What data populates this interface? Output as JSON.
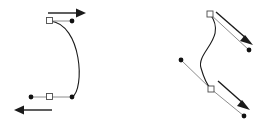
{
  "figure": {
    "background_color": "#ffffff",
    "width": 277,
    "height": 127,
    "curve_color": "#1a1a1a",
    "handle_line_color": "#6e6e6e",
    "anchor_fill_color": "#ffffff",
    "anchor_stroke_color": "#4a4a4a",
    "control_dot_color": "#111111",
    "arrow_color": "#1a1a1a"
  },
  "shapes": {
    "left_curve": {
      "name": "c-shaped-arc",
      "path": "M 50 21 C 82 24 85 90 72 97",
      "anchors": [
        {
          "label": "top-anchor",
          "x": 50,
          "y": 21
        },
        {
          "label": "bottom-anchor",
          "x": 50,
          "y": 97
        }
      ],
      "control_dots": [
        {
          "label": "top-handle-dot",
          "x": 72,
          "y": 21
        },
        {
          "label": "bottom-handle-dot-left",
          "x": 31,
          "y": 97
        },
        {
          "label": "bottom-handle-dot-right",
          "x": 72,
          "y": 97
        }
      ],
      "handle_lines": [
        {
          "label": "top-handle-line",
          "x1": 50,
          "y1": 21,
          "x2": 72,
          "y2": 21
        },
        {
          "label": "bottom-handle-line",
          "x1": 31,
          "y1": 97,
          "x2": 72,
          "y2": 97
        }
      ],
      "arrows": [
        {
          "label": "top-direction-arrow",
          "direction": "right",
          "x1": 48,
          "y1": 13,
          "x2": 86,
          "y2": 13
        },
        {
          "label": "bottom-direction-arrow",
          "direction": "left",
          "x1": 52,
          "y1": 110,
          "x2": 14,
          "y2": 110
        }
      ]
    },
    "right_curve": {
      "name": "s-shaped-curve",
      "path": "M 210 14 C 228 38 196 52 201 68 C 205 82 208 86 211 89",
      "anchors": [
        {
          "label": "top-anchor",
          "x": 210,
          "y": 14
        },
        {
          "label": "bottom-anchor",
          "x": 211,
          "y": 89
        }
      ],
      "control_dots": [
        {
          "label": "top-handle-dot",
          "x": 249,
          "y": 50
        },
        {
          "label": "mid-handle-dot",
          "x": 181,
          "y": 60
        },
        {
          "label": "bottom-handle-dot",
          "x": 244,
          "y": 116
        }
      ],
      "handle_lines": [
        {
          "label": "top-handle-line",
          "x1": 210,
          "y1": 14,
          "x2": 249,
          "y2": 50
        },
        {
          "label": "mid-handle-line",
          "x1": 181,
          "y1": 60,
          "x2": 211,
          "y2": 89
        },
        {
          "label": "bottom-handle-line",
          "x1": 211,
          "y1": 89,
          "x2": 244,
          "y2": 116
        }
      ],
      "arrows": [
        {
          "label": "top-direction-arrow",
          "direction": "down-right",
          "x1": 216,
          "y1": 12,
          "x2": 253,
          "y2": 45
        },
        {
          "label": "bottom-direction-arrow",
          "direction": "down-right",
          "x1": 218,
          "y1": 81,
          "x2": 250,
          "y2": 110
        }
      ]
    }
  }
}
